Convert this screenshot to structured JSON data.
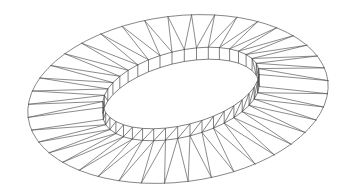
{
  "diagram": {
    "type": "wireframe-elliptical-ring-roof",
    "background": "#ffffff",
    "stroke_color": "#5a5a5a",
    "segments": 40,
    "outer_ellipse": {
      "cx": 178,
      "cy": 99,
      "rx": 151,
      "ry": 83,
      "rotation_deg": -7
    },
    "inner_ring_top": {
      "cx": 181,
      "cy": 88,
      "rx": 80,
      "ry": 37,
      "rotation_deg": -14
    },
    "inner_ring_wall_height": 12,
    "bracing": "zigzag-triangulated"
  }
}
